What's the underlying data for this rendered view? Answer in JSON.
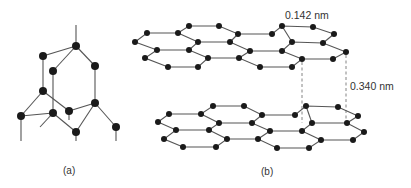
{
  "figure": {
    "panel_a": {
      "caption": "(a)",
      "structure": "diamond",
      "atoms": [
        {
          "id": "A",
          "x": 76,
          "y": 46
        },
        {
          "id": "B",
          "x": 43,
          "y": 56
        },
        {
          "id": "C",
          "x": 95,
          "y": 66
        },
        {
          "id": "D",
          "x": 53,
          "y": 71
        },
        {
          "id": "E",
          "x": 43,
          "y": 91
        },
        {
          "id": "F",
          "x": 95,
          "y": 103
        },
        {
          "id": "G",
          "x": 21,
          "y": 116
        },
        {
          "id": "H",
          "x": 53,
          "y": 113
        },
        {
          "id": "I",
          "x": 69,
          "y": 111
        },
        {
          "id": "J",
          "x": 76,
          "y": 132
        },
        {
          "id": "K",
          "x": 116,
          "y": 127
        }
      ]
    },
    "panel_b": {
      "caption": "(b)",
      "structure": "graphite",
      "bond_length_label": "0.142 nm",
      "interlayer_spacing_label": "0.340 nm"
    }
  }
}
